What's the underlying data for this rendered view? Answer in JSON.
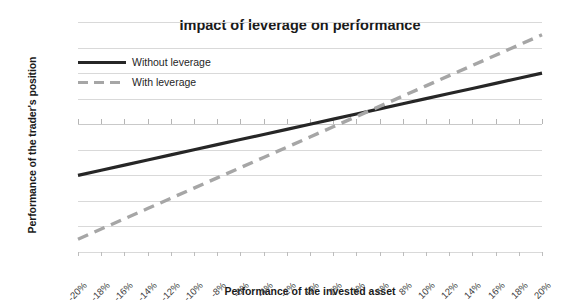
{
  "chart_data": {
    "type": "line",
    "title": "Impact of leverage on performance",
    "xlabel": "Performance of the invested asset",
    "ylabel": "Performance of the trader's position",
    "xlim": [
      -20,
      20
    ],
    "ylim": [
      -50,
      40
    ],
    "grid": true,
    "legend_position": "inside-top-left",
    "x": [
      -20,
      -18,
      -16,
      -14,
      -12,
      -10,
      -8,
      -6,
      -4,
      -2,
      0,
      2,
      4,
      6,
      8,
      10,
      12,
      14,
      16,
      18,
      20
    ],
    "x_tick_labels": [
      "-20%",
      "-18%",
      "-16%",
      "-14%",
      "-12%",
      "-10%",
      "-8%",
      "-6%",
      "-4%",
      "-2%",
      "0%",
      "2%",
      "4%",
      "6%",
      "8%",
      "10%",
      "12%",
      "14%",
      "16%",
      "18%",
      "20%"
    ],
    "y_tick_labels": [
      "40%",
      "30%",
      "20%",
      "10%",
      "0%",
      "-10%",
      "-20%",
      "-30%",
      "-40%",
      "-50%"
    ],
    "y_ticks": [
      40,
      30,
      20,
      10,
      0,
      -10,
      -20,
      -30,
      -40,
      -50
    ],
    "series": [
      {
        "name": "Without leverage",
        "style": "solid",
        "color": "#262626",
        "values": [
          -20,
          -18,
          -16,
          -14,
          -12,
          -10,
          -8,
          -6,
          -4,
          -2,
          0,
          2,
          4,
          6,
          8,
          10,
          12,
          14,
          16,
          18,
          20
        ]
      },
      {
        "name": "With leverage",
        "style": "dashed",
        "color": "#a6a6a6",
        "values": [
          -45,
          -41,
          -37,
          -33,
          -29,
          -25,
          -21,
          -17,
          -13,
          -9,
          -5,
          -1,
          3,
          7,
          11,
          15,
          19,
          23,
          27,
          31,
          35
        ]
      }
    ]
  },
  "legend": {
    "items": [
      {
        "label": "Without leverage"
      },
      {
        "label": "With leverage"
      }
    ]
  },
  "colors": {
    "series_solid": "#262626",
    "series_dashed": "#a6a6a6",
    "gridline": "#d9d9d9",
    "text": "#262626"
  }
}
